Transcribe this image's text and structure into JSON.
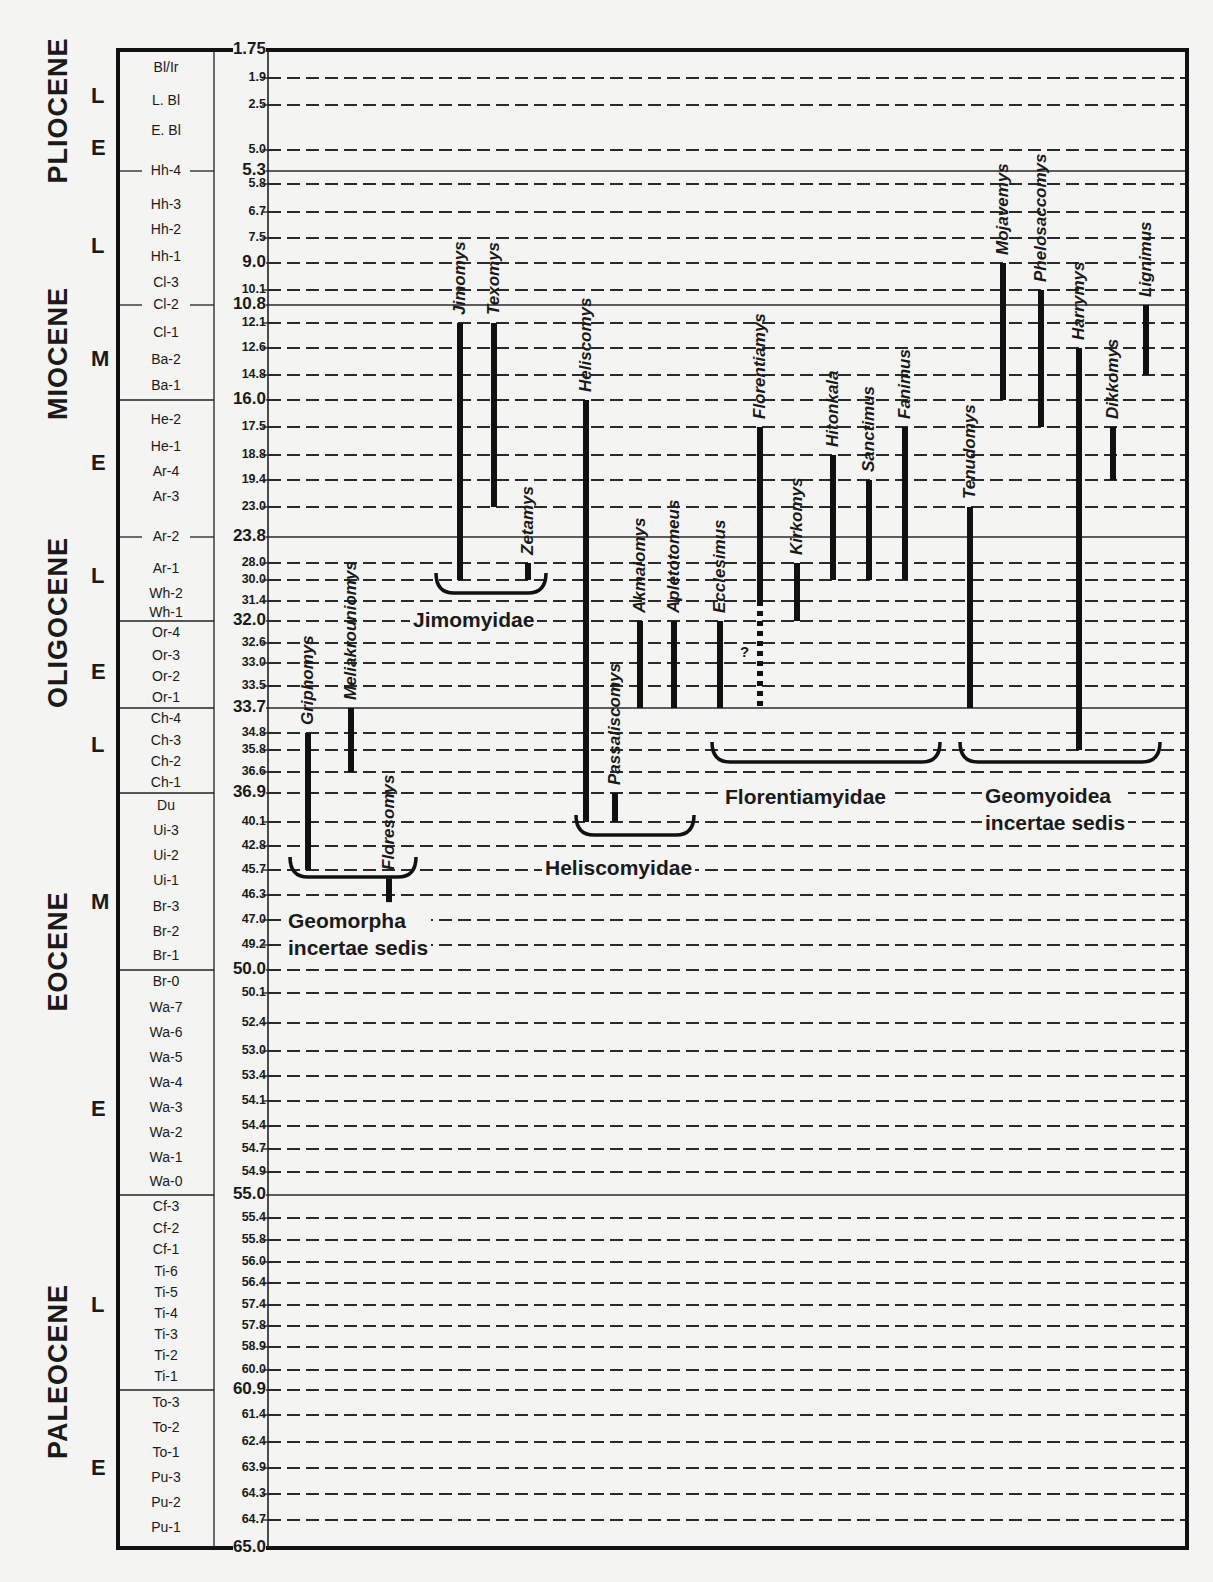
{
  "chart_data": {
    "type": "range-chart",
    "title": "",
    "ylabel": "Age (Ma)",
    "ylim": [
      1.75,
      65.0
    ],
    "y_pixel_map": [
      [
        1.75,
        50
      ],
      [
        1.9,
        78
      ],
      [
        2.5,
        105
      ],
      [
        5.0,
        150
      ],
      [
        5.3,
        171
      ],
      [
        5.8,
        184
      ],
      [
        6.7,
        212
      ],
      [
        7.5,
        238
      ],
      [
        9.0,
        263
      ],
      [
        10.1,
        290
      ],
      [
        10.8,
        305
      ],
      [
        12.1,
        323
      ],
      [
        12.6,
        348
      ],
      [
        14.8,
        375
      ],
      [
        16.0,
        400
      ],
      [
        17.5,
        427
      ],
      [
        18.8,
        455
      ],
      [
        19.4,
        480
      ],
      [
        23.0,
        507
      ],
      [
        23.8,
        537
      ],
      [
        28.0,
        563
      ],
      [
        30.0,
        580
      ],
      [
        31.4,
        601
      ],
      [
        32.0,
        621
      ],
      [
        32.6,
        643
      ],
      [
        33.0,
        663
      ],
      [
        33.5,
        686
      ],
      [
        33.7,
        708
      ],
      [
        34.8,
        733
      ],
      [
        35.8,
        750
      ],
      [
        36.6,
        772
      ],
      [
        36.9,
        793
      ],
      [
        40.1,
        822
      ],
      [
        42.8,
        846
      ],
      [
        45.7,
        870
      ],
      [
        46.3,
        895
      ],
      [
        47.0,
        920
      ],
      [
        49.2,
        945
      ],
      [
        50.0,
        970
      ],
      [
        50.1,
        993
      ],
      [
        52.4,
        1023
      ],
      [
        53.0,
        1051
      ],
      [
        53.4,
        1076
      ],
      [
        54.1,
        1101
      ],
      [
        54.4,
        1126
      ],
      [
        54.7,
        1149
      ],
      [
        54.9,
        1172
      ],
      [
        55.0,
        1195
      ],
      [
        55.4,
        1218
      ],
      [
        55.8,
        1240
      ],
      [
        56.0,
        1262
      ],
      [
        56.4,
        1283
      ],
      [
        57.4,
        1305
      ],
      [
        57.8,
        1326
      ],
      [
        58.9,
        1347
      ],
      [
        60.0,
        1370
      ],
      [
        60.9,
        1390
      ],
      [
        61.4,
        1415
      ],
      [
        62.4,
        1442
      ],
      [
        63.9,
        1468
      ],
      [
        64.3,
        1494
      ],
      [
        64.7,
        1520
      ],
      [
        65.0,
        1548
      ]
    ],
    "epochs": [
      {
        "name": "PLIOCENE",
        "from": 1.75,
        "to": 5.3
      },
      {
        "name": "MIOCENE",
        "from": 5.3,
        "to": 23.8
      },
      {
        "name": "OLIGOCENE",
        "from": 23.8,
        "to": 33.7
      },
      {
        "name": "EOCENE",
        "from": 33.7,
        "to": 55.0
      },
      {
        "name": "PALEOCENE",
        "from": 55.0,
        "to": 65.0
      }
    ],
    "subepochs": [
      {
        "label": "L",
        "age": 2.3
      },
      {
        "label": "E",
        "age": 4.9
      },
      {
        "label": "L",
        "age": 8.0
      },
      {
        "label": "M",
        "age": 13.5
      },
      {
        "label": "E",
        "age": 19.0
      },
      {
        "label": "L",
        "age": 29.5
      },
      {
        "label": "E",
        "age": 33.2
      },
      {
        "label": "L",
        "age": 35.5
      },
      {
        "label": "M",
        "age": 46.5
      },
      {
        "label": "E",
        "age": 54.2
      },
      {
        "label": "L",
        "age": 57.4
      },
      {
        "label": "E",
        "age": 63.9
      }
    ],
    "nalma_zones": [
      {
        "label": "Bl/Ir",
        "y": 68
      },
      {
        "label": "L. Bl",
        "y": 101
      },
      {
        "label": "E. Bl",
        "y": 131
      },
      {
        "label": "Hh-4",
        "y": 171,
        "rule": true
      },
      {
        "label": "Hh-3",
        "y": 205
      },
      {
        "label": "Hh-2",
        "y": 230
      },
      {
        "label": "Hh-1",
        "y": 257
      },
      {
        "label": "Cl-3",
        "y": 283
      },
      {
        "label": "Cl-2",
        "y": 305,
        "rule": true
      },
      {
        "label": "Cl-1",
        "y": 333
      },
      {
        "label": "Ba-2",
        "y": 360
      },
      {
        "label": "Ba-1",
        "y": 386
      },
      {
        "label": "He-2",
        "y": 420
      },
      {
        "label": "He-1",
        "y": 447
      },
      {
        "label": "Ar-4",
        "y": 472
      },
      {
        "label": "Ar-3",
        "y": 497
      },
      {
        "label": "Ar-2",
        "y": 537,
        "rule": true
      },
      {
        "label": "Ar-1",
        "y": 569
      },
      {
        "label": "Wh-2",
        "y": 594
      },
      {
        "label": "Wh-1",
        "y": 613
      },
      {
        "label": "Or-4",
        "y": 633
      },
      {
        "label": "Or-3",
        "y": 656
      },
      {
        "label": "Or-2",
        "y": 677
      },
      {
        "label": "Or-1",
        "y": 698
      },
      {
        "label": "Ch-4",
        "y": 719
      },
      {
        "label": "Ch-3",
        "y": 741
      },
      {
        "label": "Ch-2",
        "y": 762
      },
      {
        "label": "Ch-1",
        "y": 783
      },
      {
        "label": "Du",
        "y": 806
      },
      {
        "label": "Ui-3",
        "y": 831
      },
      {
        "label": "Ui-2",
        "y": 856
      },
      {
        "label": "Ui-1",
        "y": 881
      },
      {
        "label": "Br-3",
        "y": 907
      },
      {
        "label": "Br-2",
        "y": 932
      },
      {
        "label": "Br-1",
        "y": 956
      },
      {
        "label": "Br-0",
        "y": 982
      },
      {
        "label": "Wa-7",
        "y": 1008
      },
      {
        "label": "Wa-6",
        "y": 1033
      },
      {
        "label": "Wa-5",
        "y": 1058
      },
      {
        "label": "Wa-4",
        "y": 1083
      },
      {
        "label": "Wa-3",
        "y": 1108
      },
      {
        "label": "Wa-2",
        "y": 1133
      },
      {
        "label": "Wa-1",
        "y": 1158
      },
      {
        "label": "Wa-0",
        "y": 1182
      },
      {
        "label": "Cf-3",
        "y": 1207
      },
      {
        "label": "Cf-2",
        "y": 1229
      },
      {
        "label": "Cf-1",
        "y": 1250
      },
      {
        "label": "Ti-6",
        "y": 1272
      },
      {
        "label": "Ti-5",
        "y": 1293
      },
      {
        "label": "Ti-4",
        "y": 1314
      },
      {
        "label": "Ti-3",
        "y": 1335
      },
      {
        "label": "Ti-2",
        "y": 1356
      },
      {
        "label": "Ti-1",
        "y": 1377
      },
      {
        "label": "To-3",
        "y": 1403
      },
      {
        "label": "To-2",
        "y": 1428
      },
      {
        "label": "To-1",
        "y": 1453
      },
      {
        "label": "Pu-3",
        "y": 1478
      },
      {
        "label": "Pu-2",
        "y": 1503
      },
      {
        "label": "Pu-1",
        "y": 1528
      }
    ],
    "major_boundaries": [
      1.75,
      5.3,
      9.0,
      10.8,
      16.0,
      23.8,
      32.0,
      33.7,
      36.9,
      50.0,
      55.0,
      60.9,
      65.0
    ],
    "solid_lines": [
      5.3,
      10.8,
      23.8,
      33.7,
      55.0
    ],
    "taxa": [
      {
        "name": "Griphomys",
        "x": 308,
        "from": 34.8,
        "to": 45.7,
        "group": "Geomorpha incertae sedis"
      },
      {
        "name": "Meliakrouniomys",
        "x": 351,
        "from": 33.7,
        "to": 36.6,
        "group": "Geomorpha incertae sedis"
      },
      {
        "name": "Floresomys",
        "x": 389,
        "from": 45.9,
        "to": 46.5,
        "group": "Geomorpha incertae sedis"
      },
      {
        "name": "Jimomys",
        "x": 460,
        "from": 12.1,
        "to": 30.0,
        "group": "Jimomyidae"
      },
      {
        "name": "Texomys",
        "x": 494,
        "from": 12.1,
        "to": 23.0,
        "group": "Jimomyidae"
      },
      {
        "name": "Zetamys",
        "x": 528,
        "from": 28.0,
        "to": 30.0,
        "group": "Jimomyidae"
      },
      {
        "name": "Heliscomys",
        "x": 586,
        "from": 16.0,
        "to": 40.1,
        "group": "Heliscomyidae"
      },
      {
        "name": "Passaliscomys",
        "x": 615,
        "from": 36.9,
        "to": 40.1,
        "group": "Heliscomyidae"
      },
      {
        "name": "Akmaiomys",
        "x": 640,
        "from": 32.0,
        "to": 33.7,
        "group": "Heliscomyidae"
      },
      {
        "name": "Apletotomeus",
        "x": 674,
        "from": 32.0,
        "to": 33.7,
        "group": "Heliscomyidae"
      },
      {
        "name": "Ecclesimus",
        "x": 720,
        "from": 32.0,
        "to": 33.7,
        "group": "Florentiamyidae"
      },
      {
        "name": "Florentiamys",
        "x": 760,
        "from": 17.5,
        "to": 31.4,
        "dotted_to": 33.7,
        "query": "?",
        "group": "Florentiamyidae"
      },
      {
        "name": "Kirkomys",
        "x": 797,
        "from": 28.0,
        "to": 32.0,
        "group": "Florentiamyidae"
      },
      {
        "name": "Hitonkala",
        "x": 833,
        "from": 18.8,
        "to": 30.0,
        "group": "Florentiamyidae"
      },
      {
        "name": "Sanctimus",
        "x": 869,
        "from": 19.4,
        "to": 30.0,
        "group": "Florentiamyidae"
      },
      {
        "name": "Fanimus",
        "x": 905,
        "from": 17.5,
        "to": 30.0,
        "group": "Florentiamyidae"
      },
      {
        "name": "Tenudomys",
        "x": 970,
        "from": 23.0,
        "to": 33.7,
        "group": "Geomyoidea incertae sedis"
      },
      {
        "name": "Mojavemys",
        "x": 1003,
        "from": 9.0,
        "to": 16.0,
        "group": "Geomyoidea incertae sedis"
      },
      {
        "name": "Phelosaccomys",
        "x": 1041,
        "from": 10.1,
        "to": 17.5,
        "group": "Geomyoidea incertae sedis"
      },
      {
        "name": "Harrymys",
        "x": 1079,
        "from": 12.6,
        "to": 35.8,
        "group": "Geomyoidea incertae sedis"
      },
      {
        "name": "Dikkomys",
        "x": 1113,
        "from": 17.5,
        "to": 19.4,
        "group": "Geomyoidea incertae sedis"
      },
      {
        "name": "Lignimus",
        "x": 1146,
        "from": 10.8,
        "to": 14.8,
        "group": "Geomyoidea incertae sedis"
      }
    ],
    "families": [
      {
        "name": "Geomorpha incertae sedis",
        "lines": [
          "Geomorpha",
          "incertae sedis"
        ],
        "bracket": [
          290,
          416,
          867
        ],
        "label_x": 285,
        "label_y": 907
      },
      {
        "name": "Jimomyidae",
        "lines": [
          "Jimomyidae"
        ],
        "bracket": [
          436,
          546,
          583
        ],
        "label_x": 410,
        "label_y": 606
      },
      {
        "name": "Heliscomyidae",
        "lines": [
          "Heliscomyidae"
        ],
        "bracket": [
          576,
          694,
          825
        ],
        "label_x": 542,
        "label_y": 854
      },
      {
        "name": "Florentiamyidae",
        "lines": [
          "Florentiamyidae"
        ],
        "bracket": [
          712,
          940,
          752
        ],
        "label_x": 722,
        "label_y": 783
      },
      {
        "name": "Geomyoidea incertae sedis",
        "lines": [
          "Geomyoidea",
          "incertae sedis"
        ],
        "bracket": [
          960,
          1160,
          752
        ],
        "label_x": 982,
        "label_y": 782
      }
    ]
  },
  "labels": {
    "epochs": [
      "PLIOCENE",
      "MIOCENE",
      "OLIGOCENE",
      "EOCENE",
      "PALEOCENE"
    ],
    "families": [
      "Geomorpha incertae sedis",
      "Jimomyidae",
      "Heliscomyidae",
      "Florentiamyidae",
      "Geomyoidea incertae sedis"
    ],
    "query_mark": "?"
  }
}
